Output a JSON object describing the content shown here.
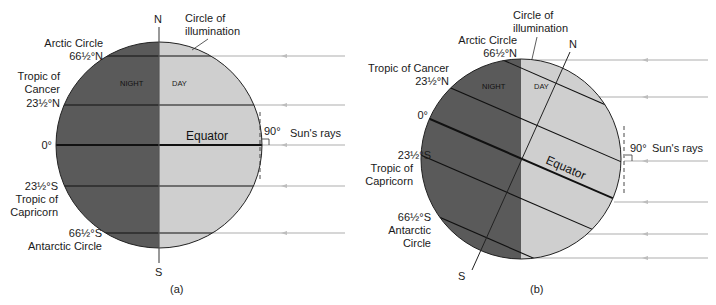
{
  "colors": {
    "night": "#5a5a5a",
    "day": "#cfcfcf",
    "line": "#111111",
    "ray": "#c8c8c8",
    "axis": "#555555"
  },
  "panel_a": {
    "caption": "(a)",
    "north": "N",
    "south": "S",
    "circle_of_illumination": [
      "Circle of",
      "illumination"
    ],
    "night": "NIGHT",
    "day": "DAY",
    "equator": "Equator",
    "angle": "90°",
    "rays_label": "Sun's rays",
    "labels": {
      "arctic": [
        "Arctic Circle",
        "66½°N"
      ],
      "cancer": [
        "Tropic of",
        "Cancer",
        "23½°N"
      ],
      "zero": "0°",
      "capricorn": [
        "23½°S",
        "Tropic of",
        "Capricorn"
      ],
      "antarctic": [
        "66½°S",
        "Antarctic Circle"
      ]
    }
  },
  "panel_b": {
    "caption": "(b)",
    "north": "N",
    "south": "S",
    "circle_of_illumination": [
      "Circle of",
      "illumination"
    ],
    "night": "NIGHT",
    "day": "DAY",
    "equator": "Equator",
    "angle": "90°",
    "rays_label": "Sun's rays",
    "labels": {
      "arctic": [
        "Arctic Circle",
        "66½°N"
      ],
      "cancer": [
        "Tropic of Cancer",
        "23½°N"
      ],
      "zero": "0°",
      "capricorn": [
        "23½°S",
        "Tropic of",
        "Capricorn"
      ],
      "antarctic": [
        "66½°S",
        "Antarctic",
        "Circle"
      ]
    }
  }
}
